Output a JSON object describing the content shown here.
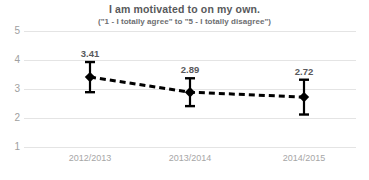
{
  "chart_data": {
    "type": "line",
    "title": "I am motivated to on my own.",
    "subtitle": "(\"1 - I totally agree\" to \"5 - I totally disagree\")",
    "xlabel": "",
    "ylabel": "",
    "categories": [
      "2012/2013",
      "2013/2014",
      "2014/2015"
    ],
    "values": [
      3.41,
      2.89,
      2.72
    ],
    "data_labels": [
      "3.41",
      "2.89",
      "2.72"
    ],
    "error_bars": {
      "lower": [
        2.89,
        2.41,
        2.12
      ],
      "upper": [
        3.93,
        3.37,
        3.32
      ]
    },
    "ylim": [
      1,
      5
    ],
    "ytick_labels": [
      "5",
      "4",
      "3",
      "2",
      "1"
    ],
    "ytick_values": [
      5,
      4,
      3,
      2,
      1
    ],
    "grid": true,
    "legend": "none",
    "colors": {
      "marker": "#000000",
      "line": "#000000",
      "gridline": "#e4e4e4",
      "title_text": "#58595b",
      "tick_text": "#a6a6a6",
      "background": "#ffffff"
    },
    "line_style": "dashed",
    "marker_style": "diamond"
  }
}
